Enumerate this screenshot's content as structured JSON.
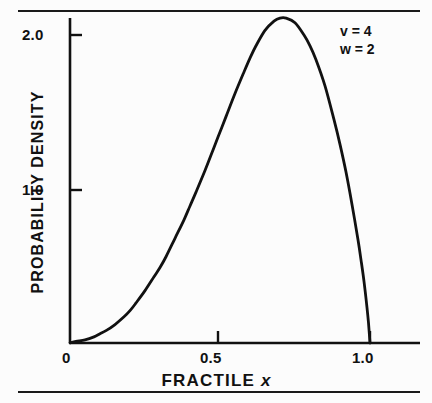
{
  "figure": {
    "top_rule": "",
    "bottom_rule": ""
  },
  "axis_titles": {
    "x_prefix": "FRACTILE",
    "x_variable": "x",
    "y": "PROBABILITY DENSITY"
  },
  "ticks": {
    "y": [
      "2.0",
      "1.0"
    ],
    "x": [
      "0",
      "0.5",
      "1.0"
    ]
  },
  "annotations": [
    "v = 4",
    "w = 2"
  ],
  "colors": {
    "curve": "#111111",
    "axis": "#111111",
    "background": "#fcfcfc"
  },
  "chart_data": {
    "type": "line",
    "title": "",
    "subtitle": "",
    "xlabel": "FRACTILE x",
    "ylabel": "PROBABILITY DENSITY",
    "xlim": [
      0,
      1.05
    ],
    "ylim": [
      0,
      2.2
    ],
    "xticks": [
      0,
      0.5,
      1.0
    ],
    "xticklabels": [
      "0",
      "0.5",
      "1.0"
    ],
    "yticks": [
      1.0,
      2.0
    ],
    "yticklabels": [
      "1.0",
      "2.0"
    ],
    "grid": false,
    "legend": false,
    "annotations": [
      {
        "text": "v = 4",
        "x": 0.88,
        "y": 2.07
      },
      {
        "text": "w = 2",
        "x": 0.88,
        "y": 1.94
      }
    ],
    "series": [
      {
        "name": "probability density (v=4, w=2)",
        "parameters": {
          "v": 4,
          "w": 2
        },
        "peak": {
          "x": 0.72,
          "y": 2.11
        },
        "x": [
          0.0,
          0.02,
          0.05,
          0.08,
          0.1,
          0.12,
          0.15,
          0.18,
          0.2,
          0.22,
          0.25,
          0.28,
          0.3,
          0.32,
          0.35,
          0.38,
          0.4,
          0.42,
          0.45,
          0.48,
          0.5,
          0.52,
          0.55,
          0.58,
          0.6,
          0.62,
          0.65,
          0.68,
          0.7,
          0.72,
          0.75,
          0.78,
          0.8,
          0.82,
          0.85,
          0.88,
          0.9,
          0.92,
          0.94,
          0.96,
          0.97,
          0.98,
          0.99,
          0.995,
          1.0
        ],
        "y": [
          0.0,
          0.01,
          0.02,
          0.04,
          0.06,
          0.08,
          0.12,
          0.17,
          0.21,
          0.26,
          0.34,
          0.43,
          0.49,
          0.56,
          0.68,
          0.8,
          0.89,
          0.98,
          1.12,
          1.27,
          1.37,
          1.47,
          1.62,
          1.76,
          1.85,
          1.93,
          2.03,
          2.09,
          2.11,
          2.11,
          2.08,
          2.0,
          1.93,
          1.84,
          1.67,
          1.45,
          1.29,
          1.11,
          0.9,
          0.67,
          0.54,
          0.4,
          0.23,
          0.13,
          0.0
        ]
      }
    ]
  }
}
